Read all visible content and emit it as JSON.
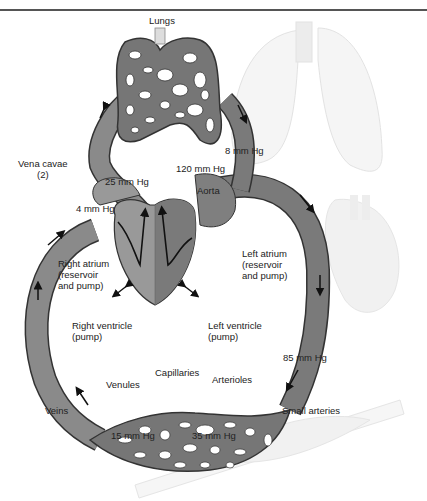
{
  "title": "Lungs",
  "labels": {
    "lungs": "Lungs",
    "vena_cavae": "Vena cavae",
    "vena_cavae_count": "(2)",
    "p_25": "25 mm Hg",
    "p_8": "8 mm Hg",
    "p_120": "120 mm Hg",
    "aorta": "Aorta",
    "p_4": "4 mm Hg",
    "right_atrium_1": "Right atrium",
    "right_atrium_2": "(reservoir",
    "right_atrium_3": "and pump)",
    "left_atrium_1": "Left atrium",
    "left_atrium_2": "(reservoir",
    "left_atrium_3": "and pump)",
    "right_ventricle_1": "Right ventricle",
    "right_ventricle_2": "(pump)",
    "left_ventricle_1": "Left ventricle",
    "left_ventricle_2": "(pump)",
    "p_85": "85 mm Hg",
    "capillaries": "Capillaries",
    "venules": "Venules",
    "arterioles": "Arterioles",
    "veins": "Veins",
    "small_arteries": "Small arteries",
    "p_15": "15 mm Hg",
    "p_35": "35 mm Hg"
  },
  "colors": {
    "vessel": "#8a8a8a",
    "vessel_dark": "#6f6f6f",
    "outline": "#333333",
    "faded": "#d9d9d9"
  }
}
